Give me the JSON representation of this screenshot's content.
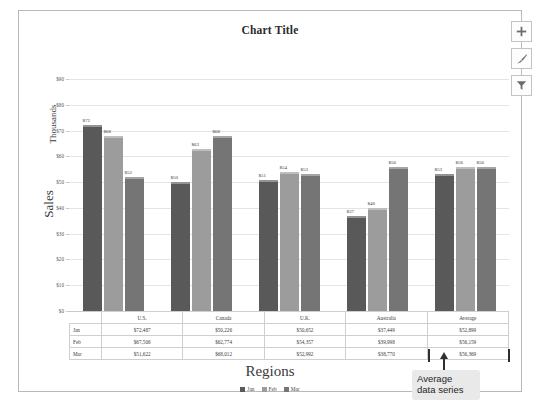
{
  "chart_data": {
    "type": "bar",
    "title": "Chart Title",
    "xlabel": "Regions",
    "ylabel": "Sales",
    "ylabel_secondary": "Thousands",
    "ylim": [
      0,
      90
    ],
    "ytick_labels": [
      "$90",
      "$80",
      "$70",
      "$60",
      "$50",
      "$40",
      "$30",
      "$20",
      "$10",
      "$0"
    ],
    "ytick_values": [
      90,
      80,
      70,
      60,
      50,
      40,
      30,
      20,
      10,
      0
    ],
    "grid": true,
    "legend_position": "bottom",
    "categories": [
      "U.S.",
      "Canada",
      "U.K.",
      "Australia",
      "Average"
    ],
    "series": [
      {
        "name": "Jan",
        "color": "#595959",
        "values": [
          72,
          50,
          51,
          37,
          53
        ],
        "labels": [
          "$72",
          "$50",
          "$51",
          "$37",
          "$53"
        ]
      },
      {
        "name": "Feb",
        "color": "#9c9c9c",
        "values": [
          68,
          63,
          54,
          40,
          56
        ],
        "labels": [
          "$68",
          "$63",
          "$54",
          "$40",
          "$56"
        ]
      },
      {
        "name": "Mar",
        "color": "#757575",
        "values": [
          52,
          68,
          53,
          56,
          56
        ],
        "labels": [
          "$52",
          "$68",
          "$53",
          "$56",
          "$56"
        ]
      }
    ]
  },
  "data_table": {
    "column_headers": [
      "U.S.",
      "Canada",
      "U.K.",
      "Australia",
      "Average"
    ],
    "rows": [
      {
        "label": "Jan",
        "cells": [
          "$72,487",
          "$50,226",
          "$50,652",
          "$37,449",
          "$52,899"
        ]
      },
      {
        "label": "Feb",
        "cells": [
          "$67,506",
          "$62,774",
          "$54,357",
          "$39,998",
          "$56,159"
        ]
      },
      {
        "label": "Mar",
        "cells": [
          "$51,622",
          "$68,012",
          "$52,992",
          "$38,770",
          "$56,369"
        ]
      }
    ]
  },
  "legend": {
    "items": [
      {
        "label": "Jan",
        "color": "#595959"
      },
      {
        "label": "Feb",
        "color": "#9c9c9c"
      },
      {
        "label": "Mar",
        "color": "#757575"
      }
    ]
  },
  "callout": {
    "line1": "Average",
    "line2": "data series"
  },
  "toolbar": {
    "buttons": [
      {
        "name": "chart-elements-icon",
        "label": "+"
      },
      {
        "name": "chart-styles-icon",
        "label": "brush"
      },
      {
        "name": "chart-filters-icon",
        "label": "filter"
      }
    ]
  },
  "colors": {
    "jan": "#595959",
    "feb": "#9c9c9c",
    "mar": "#757575",
    "grid": "#e4e4e4",
    "frame": "#b9b9b9",
    "callout_bg": "#e9e9e9"
  }
}
